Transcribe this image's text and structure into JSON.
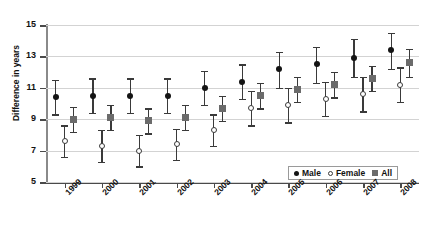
{
  "title_fragment": "",
  "legend": {
    "position": "bottom-right",
    "entries": [
      {
        "label": "Male",
        "marker": "filled-circle",
        "color": "#141414"
      },
      {
        "label": "Female",
        "marker": "open-circle",
        "color": "#3a3a3a"
      },
      {
        "label": "All",
        "marker": "filled-square",
        "color": "#6b6b6b"
      }
    ]
  },
  "chart_data": {
    "type": "scatter",
    "title": "",
    "xlabel": "",
    "ylabel": "Difference in years",
    "ylim": [
      5,
      15
    ],
    "yticks": [
      5,
      7,
      9,
      11,
      13,
      15
    ],
    "grid": true,
    "error_bars": "95% confidence interval",
    "categories": [
      "1999",
      "2000",
      "2001",
      "2002",
      "2003",
      "2004",
      "2005",
      "2006",
      "2007",
      "2008"
    ],
    "series": [
      {
        "name": "Male",
        "marker": "filled-circle",
        "color": "#141414",
        "values": [
          10.4,
          10.5,
          10.5,
          10.5,
          11.0,
          11.4,
          12.2,
          12.5,
          12.9,
          13.4
        ],
        "ci_low": [
          9.3,
          9.4,
          9.4,
          9.4,
          9.9,
          10.3,
          11.0,
          11.3,
          11.7,
          12.2
        ],
        "ci_high": [
          11.5,
          11.6,
          11.6,
          11.6,
          12.1,
          12.5,
          13.3,
          13.6,
          14.1,
          14.5
        ]
      },
      {
        "name": "Female",
        "marker": "open-circle",
        "color": "#3a3a3a",
        "values": [
          7.6,
          7.3,
          7.0,
          7.4,
          8.3,
          9.7,
          9.9,
          10.3,
          10.6,
          11.2
        ],
        "ci_low": [
          6.6,
          6.3,
          6.0,
          6.4,
          7.3,
          8.6,
          8.8,
          9.2,
          9.5,
          10.1
        ],
        "ci_high": [
          8.6,
          8.3,
          8.0,
          8.4,
          9.3,
          10.8,
          11.0,
          11.4,
          11.7,
          12.3
        ]
      },
      {
        "name": "All",
        "marker": "filled-square",
        "color": "#6b6b6b",
        "values": [
          9.0,
          9.1,
          8.9,
          9.1,
          9.7,
          10.5,
          10.9,
          11.2,
          11.6,
          12.6
        ],
        "ci_low": [
          8.2,
          8.3,
          8.1,
          8.3,
          8.9,
          9.7,
          10.1,
          10.4,
          10.8,
          11.7
        ],
        "ci_high": [
          9.8,
          9.9,
          9.7,
          9.9,
          10.5,
          11.3,
          11.7,
          12.0,
          12.4,
          13.5
        ]
      }
    ]
  }
}
